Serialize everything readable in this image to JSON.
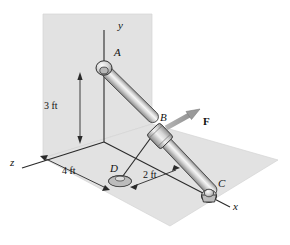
{
  "figure": {
    "domain": "engineering-statics-diagram",
    "background_color": "#ffffff"
  },
  "colors": {
    "wall_plane": "#e2e2e2",
    "floor_plane": "#e2e2e2",
    "plane_edge": "#cfcfcf",
    "axis_line": "#2a2a2a",
    "dimension_line": "#2a2a2a",
    "rod_light": "#f4f4f4",
    "rod_mid": "#c6c6c6",
    "rod_dark": "#8e8e8e",
    "rod_outline": "#3a3a3a",
    "joint_fill": "#d4d4d4",
    "joint_outline": "#2f2f2f",
    "collar_fill": "#bdbdbd",
    "force_arrow": "#9a9a9a",
    "force_arrow_outline": "#6f6f6f",
    "cable": "#2a2a2a",
    "text": "#111111"
  },
  "axes": [
    {
      "name": "y-axis",
      "label": "y",
      "label_x": 118,
      "label_y": 26
    },
    {
      "name": "z-axis",
      "label": "z",
      "label_x": 12,
      "label_y": 164
    },
    {
      "name": "x-axis",
      "label": "x",
      "label_x": 234,
      "label_y": 208
    }
  ],
  "points": [
    {
      "name": "point-a",
      "label": "A",
      "label_x": 109,
      "label_y": 53,
      "type": "ball-joint"
    },
    {
      "name": "point-b",
      "label": "B",
      "label_x": 162,
      "label_y": 118,
      "type": "collar"
    },
    {
      "name": "point-c",
      "label": "C",
      "label_x": 219,
      "label_y": 184,
      "type": "ball-and-socket"
    },
    {
      "name": "point-d",
      "label": "D",
      "label_x": 112,
      "label_y": 168,
      "type": "base-support"
    }
  ],
  "dimensions": [
    {
      "name": "dimension-3ft",
      "label": "3 ft",
      "label_x": 46,
      "label_y": 106,
      "axis": "y",
      "value": 3,
      "unit": "ft"
    },
    {
      "name": "dimension-4ft",
      "label": "4 ft",
      "label_x": 70,
      "label_y": 172,
      "axis": "z",
      "value": 4,
      "unit": "ft"
    },
    {
      "name": "dimension-2ft",
      "label": "2 ft",
      "label_x": 144,
      "label_y": 176,
      "axis": "x",
      "value": 2,
      "unit": "ft"
    }
  ],
  "force": {
    "name": "force-f",
    "label": "F",
    "label_x": 205,
    "label_y": 122,
    "direction": "up-right"
  },
  "members": [
    {
      "name": "rod-ac",
      "from": "A",
      "to": "C",
      "style": "cylindrical-rod"
    },
    {
      "name": "cable-bd",
      "from": "B",
      "to": "D",
      "style": "thin-line"
    }
  ]
}
